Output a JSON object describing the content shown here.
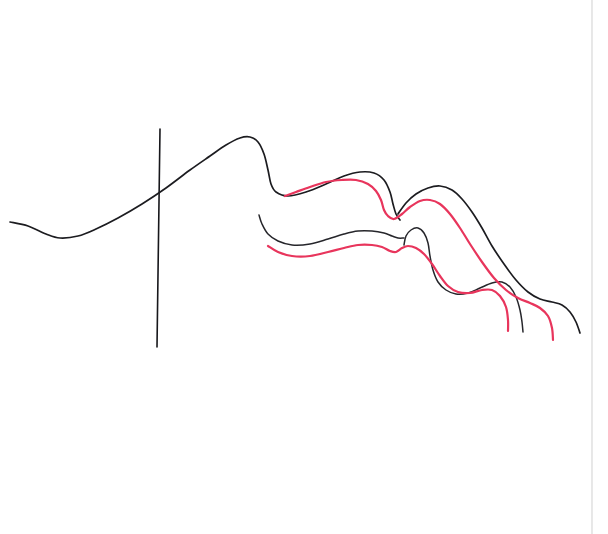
{
  "figure": {
    "background_color": "#ffffff",
    "width": 608,
    "height": 534,
    "caption": ""
  },
  "palette": {
    "black_ink": "#1c1c20",
    "red_ink": "#e8355c",
    "paper": "#ffffff",
    "page_edge": "#d8d8d8"
  },
  "chart_data": {
    "type": "line",
    "xlabel": "",
    "ylabel": "",
    "xlim": [
      0,
      608
    ],
    "ylim": [
      534,
      0
    ],
    "grid": false,
    "legend": null,
    "annotations": [
      {
        "name": "vertical-reference-line",
        "color": "#17171b",
        "x1": 160,
        "y1": 129,
        "x2": 157,
        "y2": 347
      },
      {
        "name": "page-edge-line",
        "color": "#d8d8d8",
        "x1": 592,
        "y1": 0,
        "x2": 592,
        "y2": 534
      }
    ],
    "series": [
      {
        "name": "black-main-upper-curve",
        "color": "#1c1c20",
        "points": [
          [
            10,
            222
          ],
          [
            28,
            226
          ],
          [
            46,
            234
          ],
          [
            60,
            238
          ],
          [
            78,
            236
          ],
          [
            96,
            229
          ],
          [
            118,
            218
          ],
          [
            142,
            204
          ],
          [
            166,
            188
          ],
          [
            190,
            170
          ],
          [
            210,
            156
          ],
          [
            226,
            145
          ],
          [
            240,
            138
          ],
          [
            250,
            137
          ],
          [
            258,
            142
          ],
          [
            264,
            154
          ],
          [
            268,
            170
          ],
          [
            271,
            184
          ],
          [
            276,
            192
          ],
          [
            288,
            196
          ],
          [
            306,
            192
          ],
          [
            326,
            184
          ],
          [
            344,
            176
          ],
          [
            360,
            172
          ],
          [
            374,
            173
          ],
          [
            384,
            180
          ],
          [
            390,
            192
          ],
          [
            393,
            204
          ],
          [
            396,
            214
          ],
          [
            400,
            220
          ]
        ]
      },
      {
        "name": "black-second-curve",
        "color": "#26262b",
        "points": [
          [
            259,
            215
          ],
          [
            262,
            224
          ],
          [
            268,
            234
          ],
          [
            278,
            241
          ],
          [
            292,
            245
          ],
          [
            310,
            244
          ],
          [
            328,
            239
          ],
          [
            344,
            234
          ],
          [
            358,
            231
          ],
          [
            372,
            231
          ],
          [
            384,
            233
          ],
          [
            392,
            236
          ],
          [
            398,
            238
          ],
          [
            404,
            238
          ]
        ]
      },
      {
        "name": "black-right-arch",
        "color": "#1c1c20",
        "points": [
          [
            398,
            214
          ],
          [
            406,
            203
          ],
          [
            416,
            194
          ],
          [
            428,
            188
          ],
          [
            440,
            186
          ],
          [
            452,
            190
          ],
          [
            462,
            199
          ],
          [
            472,
            212
          ],
          [
            482,
            228
          ],
          [
            492,
            246
          ],
          [
            504,
            264
          ],
          [
            516,
            280
          ],
          [
            528,
            292
          ],
          [
            540,
            299
          ],
          [
            552,
            302
          ],
          [
            562,
            305
          ],
          [
            570,
            312
          ],
          [
            576,
            322
          ],
          [
            580,
            333
          ]
        ]
      },
      {
        "name": "black-inner-hook",
        "color": "#26262b",
        "points": [
          [
            404,
            245
          ],
          [
            406,
            236
          ],
          [
            411,
            230
          ],
          [
            418,
            228
          ],
          [
            424,
            233
          ],
          [
            428,
            243
          ],
          [
            430,
            256
          ],
          [
            433,
            270
          ],
          [
            438,
            282
          ],
          [
            446,
            290
          ],
          [
            456,
            294
          ],
          [
            468,
            293
          ],
          [
            480,
            288
          ],
          [
            492,
            283
          ],
          [
            502,
            282
          ],
          [
            510,
            287
          ],
          [
            516,
            297
          ],
          [
            520,
            310
          ],
          [
            522,
            322
          ],
          [
            523,
            332
          ]
        ]
      },
      {
        "name": "red-upper-curve",
        "color": "#e8355c",
        "points": [
          [
            285,
            196
          ],
          [
            296,
            192
          ],
          [
            310,
            187
          ],
          [
            326,
            182
          ],
          [
            342,
            180
          ],
          [
            356,
            180
          ],
          [
            368,
            184
          ],
          [
            376,
            191
          ],
          [
            381,
            200
          ],
          [
            384,
            210
          ],
          [
            388,
            216
          ],
          [
            394,
            219
          ],
          [
            402,
            214
          ],
          [
            410,
            207
          ],
          [
            420,
            201
          ],
          [
            430,
            200
          ],
          [
            440,
            204
          ],
          [
            450,
            214
          ],
          [
            460,
            228
          ],
          [
            470,
            244
          ],
          [
            482,
            262
          ],
          [
            494,
            278
          ],
          [
            506,
            290
          ],
          [
            518,
            298
          ],
          [
            530,
            303
          ],
          [
            540,
            308
          ],
          [
            548,
            316
          ],
          [
            552,
            328
          ],
          [
            553,
            340
          ]
        ]
      },
      {
        "name": "red-lower-curve",
        "color": "#e8355c",
        "points": [
          [
            268,
            246
          ],
          [
            278,
            252
          ],
          [
            292,
            256
          ],
          [
            310,
            256
          ],
          [
            328,
            252
          ],
          [
            344,
            248
          ],
          [
            358,
            245
          ],
          [
            372,
            245
          ],
          [
            382,
            247
          ],
          [
            390,
            251
          ],
          [
            396,
            252
          ],
          [
            402,
            248
          ],
          [
            408,
            246
          ],
          [
            416,
            248
          ],
          [
            424,
            254
          ],
          [
            432,
            264
          ],
          [
            440,
            276
          ],
          [
            448,
            286
          ],
          [
            458,
            292
          ],
          [
            470,
            293
          ],
          [
            482,
            290
          ],
          [
            492,
            290
          ],
          [
            500,
            296
          ],
          [
            506,
            307
          ],
          [
            508,
            320
          ],
          [
            508,
            331
          ]
        ]
      }
    ]
  }
}
